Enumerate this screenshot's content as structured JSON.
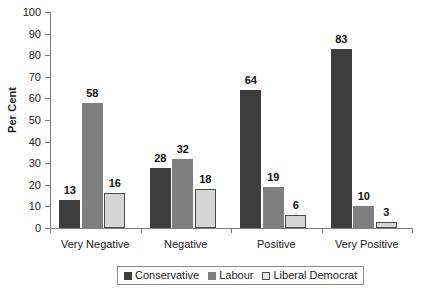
{
  "chart_data": {
    "type": "bar",
    "title": "",
    "xlabel": "",
    "ylabel": "Per Cent",
    "ylim": [
      0,
      100
    ],
    "ytick_step": 10,
    "yticks": [
      "0",
      "10",
      "20",
      "30",
      "40",
      "50",
      "60",
      "70",
      "80",
      "90",
      "100"
    ],
    "grid": false,
    "legend_position": "bottom-center",
    "categories": [
      "Very Negative",
      "Negative",
      "Positive",
      "Very Positive"
    ],
    "series": [
      {
        "name": "Conservative",
        "color": "#3d3d3d",
        "values": [
          13,
          28,
          64,
          83
        ]
      },
      {
        "name": "Labour",
        "color": "#7f7f7f",
        "values": [
          58,
          32,
          19,
          10
        ]
      },
      {
        "name": "Liberal Democrat",
        "color": "#d5d5d5",
        "values": [
          16,
          18,
          6,
          3
        ]
      }
    ],
    "data_labels": [
      [
        "13",
        "58",
        "16"
      ],
      [
        "28",
        "32",
        "18"
      ],
      [
        "64",
        "19",
        "6"
      ],
      [
        "83",
        "10",
        "3"
      ]
    ]
  },
  "legend": {
    "items": [
      {
        "label": "Conservative"
      },
      {
        "label": "Labour"
      },
      {
        "label": "Liberal Democrat"
      }
    ]
  }
}
